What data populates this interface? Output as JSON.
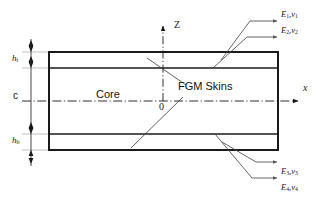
{
  "figure": {
    "background_color": "#ffffff",
    "line_color": "#1a1a1a",
    "thin_line_color": "#9a9a9a"
  },
  "labels": {
    "core": "Core",
    "fgm_skins": "FGM Skins",
    "origin": "0",
    "thickness_top": "h",
    "thickness_top_sub": "t",
    "thickness_bottom": "h",
    "thickness_bottom_sub": "b",
    "core_thickness": "c"
  },
  "axes": {
    "vertical_label": "Z",
    "horizontal_label": "x"
  },
  "material_callouts": [
    {
      "id": "e1",
      "modulus": "E",
      "modulus_sub": "1",
      "poisson": "ν",
      "poisson_sub": "1",
      "separator": ","
    },
    {
      "id": "e2",
      "modulus": "E",
      "modulus_sub": "2",
      "poisson": "ν",
      "poisson_sub": "2",
      "separator": ","
    },
    {
      "id": "e3",
      "modulus": "E",
      "modulus_sub": "3",
      "poisson": "ν",
      "poisson_sub": "3",
      "separator": ","
    },
    {
      "id": "e4",
      "modulus": "E",
      "modulus_sub": "4",
      "poisson": "ν",
      "poisson_sub": "4",
      "separator": ","
    }
  ],
  "geometry": {
    "beam_left": 49,
    "beam_right": 278,
    "beam_top": 52,
    "beam_bottom": 150,
    "top_skin_divider": 68,
    "bottom_skin_divider": 134,
    "midplane": 101,
    "z_axis_x": 163,
    "dimension_line_x": 31
  }
}
